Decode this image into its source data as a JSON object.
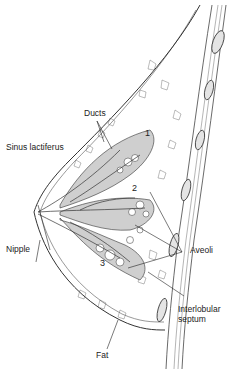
{
  "diagram": {
    "labels": {
      "ducts": "Ducts",
      "sinus": "Sinus lactiferus",
      "nipple": "Nipple",
      "aveoli": "Aveoli",
      "interlobular_1": "Interlobular",
      "interlobular_2": "septum",
      "fat": "Fat"
    },
    "lobule_numbers": [
      "1",
      "2",
      "3"
    ],
    "colors": {
      "line": "#333333",
      "lobule_fill": "#cfcfcf",
      "background": "#ffffff"
    }
  }
}
